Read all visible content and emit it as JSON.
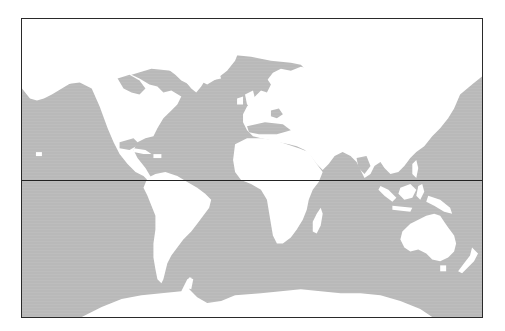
{
  "map": {
    "type": "world-map",
    "projection": "cylindrical",
    "colors": {
      "ocean": "#b9b9b9",
      "land": "#ffffff",
      "frame": "#2a2a2a",
      "equator": "#222222"
    },
    "features": {
      "equator_line": true,
      "frame": true
    },
    "landmasses": [
      "north-america",
      "greenland",
      "south-america",
      "europe",
      "africa",
      "madagascar",
      "asia",
      "japan",
      "southeast-asia-islands",
      "australia",
      "tasmania",
      "new-zealand",
      "antarctica",
      "british-isles",
      "iceland",
      "caribbean-islands",
      "hawaii"
    ]
  }
}
